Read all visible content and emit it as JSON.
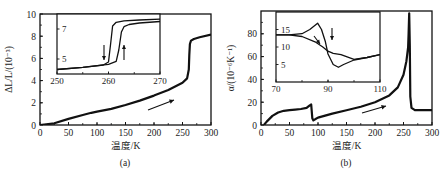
{
  "chart_data": [
    {
      "id": "a",
      "type": "line",
      "caption": "(a)",
      "title": "",
      "xlabel": "温度/K",
      "ylabel": "ΔL/L/(10⁻³)",
      "xlim": [
        0,
        300
      ],
      "ylim": [
        0,
        10
      ],
      "xticks": [
        "0",
        "50",
        "100",
        "150",
        "200",
        "250",
        "300"
      ],
      "yticks": [
        "0",
        "2",
        "4",
        "6",
        "8",
        "10"
      ],
      "grid": false,
      "annotation": "arrow pointing up-right (heating direction)",
      "series": [
        {
          "name": "ΔL/L",
          "x": [
            0,
            25,
            50,
            75,
            90,
            100,
            125,
            150,
            175,
            200,
            225,
            250,
            258,
            261,
            262,
            263,
            265,
            270,
            280,
            300
          ],
          "y": [
            0.0,
            0.15,
            0.55,
            0.9,
            1.1,
            1.2,
            1.45,
            1.8,
            2.2,
            2.65,
            3.15,
            3.8,
            4.2,
            5.0,
            6.3,
            7.3,
            7.6,
            7.75,
            7.9,
            8.15
          ]
        }
      ],
      "inset": {
        "xlim": [
          250,
          270
        ],
        "ylim": [
          4,
          8
        ],
        "xticks": [
          "250",
          "260",
          "270"
        ],
        "yticks": [
          "5",
          "7"
        ],
        "annotation": "thermal hysteresis loop; down arrow (cooling) left branch, up arrow (heating) right branch",
        "series": [
          {
            "name": "cooling",
            "x": [
              250,
              255,
              259,
              260,
              260.4,
              260.8,
              261.5,
              263,
              266,
              270
            ],
            "y": [
              4.3,
              4.45,
              4.6,
              4.8,
              6.0,
              7.2,
              7.45,
              7.55,
              7.6,
              7.65
            ]
          },
          {
            "name": "heating",
            "x": [
              250,
              255,
              260,
              261.5,
              262,
              262.5,
              263,
              264,
              266,
              270
            ],
            "y": [
              4.3,
              4.45,
              4.65,
              4.85,
              5.6,
              6.8,
              7.15,
              7.3,
              7.4,
              7.5
            ]
          }
        ]
      }
    },
    {
      "id": "b",
      "type": "line",
      "caption": "(b)",
      "title": "",
      "xlabel": "温度/K",
      "ylabel": "α/(10⁻⁶K⁻¹)",
      "xlim": [
        0,
        300
      ],
      "ylim": [
        0,
        100
      ],
      "xticks": [
        "0",
        "50",
        "100",
        "150",
        "200",
        "250",
        "300"
      ],
      "yticks": [
        "0",
        "20",
        "40",
        "60",
        "80"
      ],
      "grid": false,
      "annotation": "arrow pointing up-right (heating direction)",
      "series": [
        {
          "name": "α",
          "x": [
            5,
            10,
            20,
            30,
            40,
            50,
            60,
            70,
            80,
            85,
            88,
            90,
            92,
            95,
            100,
            125,
            150,
            175,
            200,
            225,
            240,
            250,
            255,
            258,
            259,
            260,
            261,
            262,
            264,
            270,
            280,
            300
          ],
          "y": [
            0,
            3,
            8,
            11,
            12.5,
            13,
            13.5,
            14,
            15,
            17,
            18,
            6,
            4,
            5,
            6.5,
            10,
            13,
            16,
            20,
            26,
            33,
            44,
            56,
            68,
            80,
            98,
            70,
            25,
            15,
            13,
            13,
            13
          ]
        }
      ],
      "inset": {
        "xlim": [
          70,
          110
        ],
        "ylim": [
          0,
          20
        ],
        "xticks": [
          "70",
          "90",
          "110"
        ],
        "yticks": [
          "5",
          "10",
          "15"
        ],
        "annotation": "two branches with arrows; heating overshoots peak then dips",
        "series": [
          {
            "name": "heating",
            "x": [
              70,
              75,
              80,
              83,
              86,
              87.5,
              89,
              90,
              92,
              94,
              96,
              100,
              105,
              110
            ],
            "y": [
              13.5,
              13.5,
              13.8,
              15.0,
              16.8,
              15.0,
              11.5,
              8.0,
              5.0,
              4.2,
              5.0,
              6.3,
              7.0,
              7.8
            ]
          },
          {
            "name": "cooling",
            "x": [
              70,
              75,
              80,
              85,
              88,
              90,
              92,
              95,
              100,
              105,
              110
            ],
            "y": [
              13.5,
              13.5,
              13.0,
              11.5,
              10.0,
              8.8,
              8.2,
              7.8,
              6.5,
              7.0,
              7.8
            ]
          }
        ]
      }
    }
  ]
}
